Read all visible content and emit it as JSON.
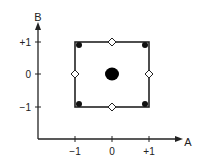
{
  "diagram": {
    "type": "factorial-design",
    "axes": {
      "x": {
        "label": "A",
        "ticks": [
          "−1",
          "0",
          "+1"
        ]
      },
      "y": {
        "label": "B",
        "ticks": [
          "+1",
          "0",
          "−1"
        ]
      }
    },
    "square": {
      "from": [
        -1,
        -1
      ],
      "to": [
        1,
        1
      ]
    },
    "points": {
      "corner_filled": [
        [
          -1,
          1
        ],
        [
          1,
          1
        ],
        [
          -1,
          -1
        ],
        [
          1,
          -1
        ]
      ],
      "edge_open_diamonds": [
        [
          0,
          1
        ],
        [
          -1,
          0
        ],
        [
          1,
          0
        ],
        [
          0,
          -1
        ]
      ],
      "center_filled_large": [
        [
          0,
          0
        ]
      ]
    },
    "colors": {
      "ink": "#222222",
      "background": "#ffffff"
    }
  }
}
